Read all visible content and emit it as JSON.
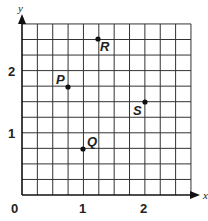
{
  "chart_data": {
    "type": "scatter",
    "title": "",
    "xlabel": "x",
    "ylabel": "y",
    "xlim": [
      0,
      2.75
    ],
    "ylim": [
      0,
      2.75
    ],
    "grid": true,
    "grid_step": 0.25,
    "x_ticks": [
      "0",
      "1",
      "2"
    ],
    "y_ticks": [
      "1",
      "2"
    ],
    "points": [
      {
        "label": "P",
        "x": 0.75,
        "y": 1.75
      },
      {
        "label": "Q",
        "x": 1.0,
        "y": 0.75
      },
      {
        "label": "R",
        "x": 1.25,
        "y": 2.5
      },
      {
        "label": "S",
        "x": 2.0,
        "y": 1.5
      }
    ]
  },
  "axes": {
    "x_label": "x",
    "y_label": "y",
    "origin_label": "0",
    "x_tick_1": "1",
    "x_tick_2": "2",
    "y_tick_1": "1",
    "y_tick_2": "2"
  },
  "labels": {
    "P": "P",
    "Q": "Q",
    "R": "R",
    "S": "S"
  }
}
